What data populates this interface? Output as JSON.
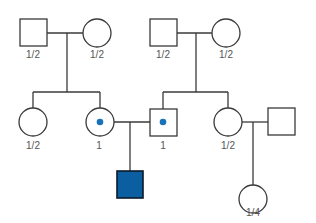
{
  "diagram": {
    "type": "pedigree",
    "colors": {
      "line": "#3a3a3a",
      "affected_fill": "#0b5fa0",
      "affected_border": "#0a1a2a",
      "carrier_dot": "#1a73b8"
    },
    "individuals": [
      {
        "id": "I-1",
        "sex": "male",
        "status": "unaffected",
        "probability_label": "1/2"
      },
      {
        "id": "I-2",
        "sex": "female",
        "status": "unaffected",
        "probability_label": "1/2"
      },
      {
        "id": "I-3",
        "sex": "male",
        "status": "unaffected",
        "probability_label": "1/2"
      },
      {
        "id": "I-4",
        "sex": "female",
        "status": "unaffected",
        "probability_label": "1/2"
      },
      {
        "id": "II-1",
        "sex": "female",
        "status": "unaffected",
        "probability_label": "1/2"
      },
      {
        "id": "II-2",
        "sex": "female",
        "status": "carrier",
        "probability_label": "1"
      },
      {
        "id": "II-3",
        "sex": "male",
        "status": "carrier",
        "probability_label": "1"
      },
      {
        "id": "II-4",
        "sex": "female",
        "status": "unaffected",
        "probability_label": "1/2"
      },
      {
        "id": "II-5",
        "sex": "male",
        "status": "unaffected",
        "probability_label": ""
      },
      {
        "id": "III-1",
        "sex": "male",
        "status": "affected",
        "probability_label": ""
      },
      {
        "id": "III-2",
        "sex": "female",
        "status": "unaffected",
        "probability_label": "1/4"
      }
    ],
    "labels": {
      "I1": "1/2",
      "I2": "1/2",
      "I3": "1/2",
      "I4": "1/2",
      "II1": "1/2",
      "II2": "1",
      "II3": "1",
      "II4": "1/2",
      "III2": "1/4"
    }
  }
}
